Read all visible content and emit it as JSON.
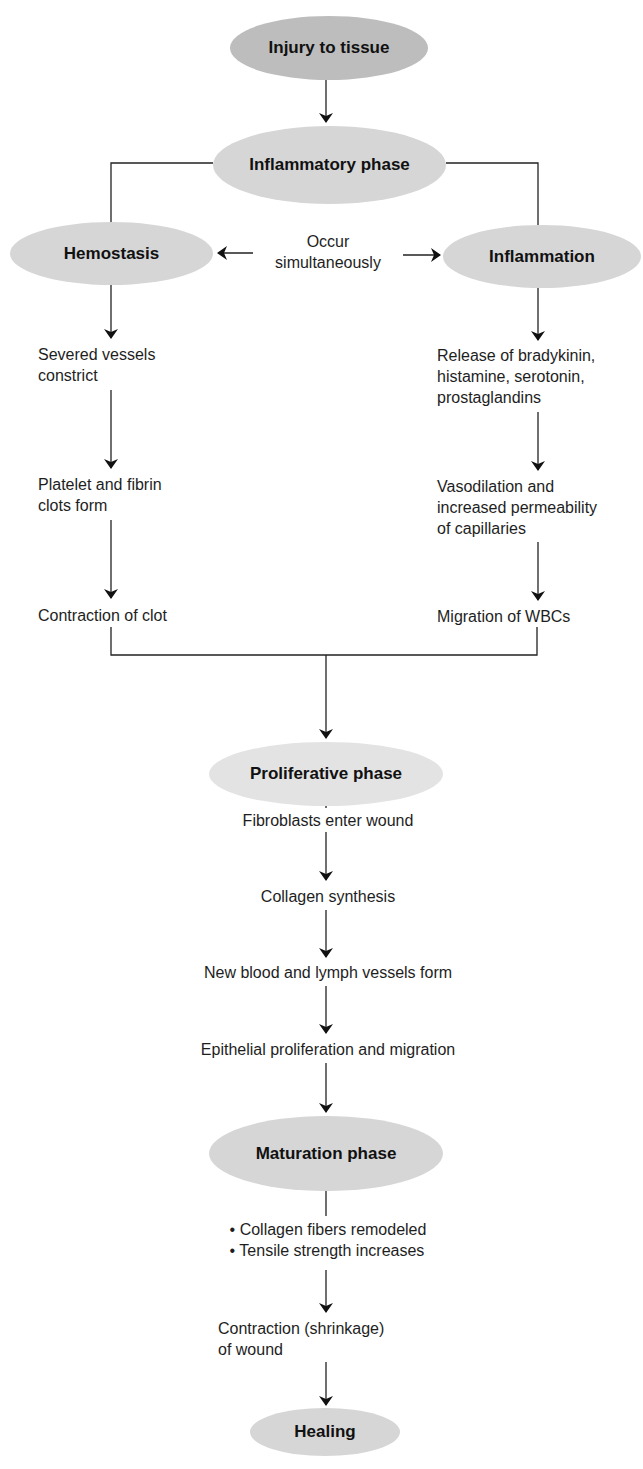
{
  "nodes": {
    "injury": "Injury to tissue",
    "inflammatory_phase": "Inflammatory phase",
    "hemostasis": "Hemostasis",
    "inflammation": "Inflammation",
    "proliferative_phase": "Proliferative phase",
    "maturation_phase": "Maturation phase",
    "healing": "Healing"
  },
  "simultaneous_label": [
    "Occur",
    "simultaneously"
  ],
  "hemostasis_steps": [
    [
      "Severed vessels",
      "constrict"
    ],
    [
      "Platelet and fibrin",
      "clots form"
    ],
    [
      "Contraction of clot"
    ]
  ],
  "inflammation_steps": [
    [
      "Release of bradykinin,",
      "histamine, serotonin,",
      "prostaglandins"
    ],
    [
      "Vasodilation and",
      "increased permeability",
      "of capillaries"
    ],
    [
      "Migration of WBCs"
    ]
  ],
  "proliferative_steps": [
    "Fibroblasts enter wound",
    "Collagen synthesis",
    "New blood and lymph vessels form",
    "Epithelial proliferation and migration"
  ],
  "maturation_bullets": [
    "• Collagen fibers remodeled",
    "• Tensile strength increases"
  ],
  "maturation_steps": [
    [
      "Contraction (shrinkage)",
      "of wound"
    ]
  ],
  "colors": {
    "ellipse_fill": "#d6d6d6",
    "ellipse_dark": "#bdbdbd",
    "line": "#1a1a1a",
    "background": "#ffffff"
  }
}
